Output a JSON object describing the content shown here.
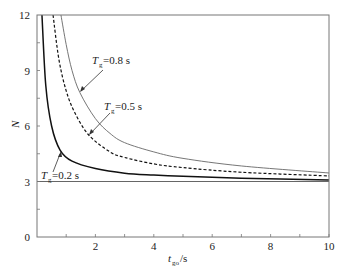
{
  "chart_data": {
    "type": "line",
    "title": "",
    "xlabel": "t_go/s",
    "xlabel_main": "t",
    "xlabel_sub": "go",
    "xlabel_suffix": "/s",
    "ylabel": "N",
    "xlim": [
      0,
      10
    ],
    "ylim": [
      0,
      12
    ],
    "xticks": [
      2,
      4,
      6,
      8,
      10
    ],
    "xtick_labels": [
      "2",
      "4",
      "6",
      "8",
      "10"
    ],
    "yticks": [
      0,
      3,
      6,
      9,
      12
    ],
    "ytick_labels": [
      "0",
      "3",
      "6",
      "9",
      "12"
    ],
    "grid": false,
    "legend": "inline annotations with arrows",
    "reference_line": {
      "y": 3,
      "style": "solid thin"
    },
    "series": [
      {
        "name": "Tg=0.2 s",
        "label_main": "T",
        "label_sub": "g",
        "label_value": "=0.2 s",
        "style": "solid",
        "x": [
          0.17,
          0.3,
          0.5,
          0.79,
          1.2,
          2,
          3,
          4,
          5,
          7,
          10
        ],
        "values": [
          12,
          8.2,
          6.0,
          4.7,
          4.1,
          3.7,
          3.45,
          3.35,
          3.28,
          3.18,
          3.08
        ]
      },
      {
        "name": "Tg=0.5 s",
        "label_main": "T",
        "label_sub": "g",
        "label_value": "=0.5 s",
        "style": "dashed",
        "x": [
          0.55,
          0.75,
          1.0,
          1.3,
          1.78,
          2.5,
          3,
          4,
          5,
          7,
          10
        ],
        "values": [
          12,
          9.6,
          7.9,
          6.7,
          5.5,
          4.6,
          4.3,
          3.95,
          3.75,
          3.5,
          3.3
        ]
      },
      {
        "name": "Tg=0.8 s",
        "label_main": "T",
        "label_sub": "g",
        "label_value": "=0.8 s",
        "style": "dotted",
        "x": [
          0.82,
          1.0,
          1.2,
          1.47,
          2,
          2.5,
          3,
          4,
          5,
          7,
          10
        ],
        "values": [
          12,
          10.4,
          9.0,
          7.8,
          6.4,
          5.6,
          5.1,
          4.6,
          4.25,
          3.84,
          3.46
        ]
      }
    ]
  }
}
